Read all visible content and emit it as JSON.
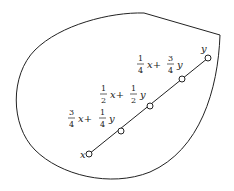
{
  "diagram": {
    "endpoints": {
      "start": {
        "label": "x",
        "cx": 89,
        "cy": 154
      },
      "end": {
        "label": "y",
        "cx": 208,
        "cy": 58
      }
    },
    "points": [
      {
        "label_a_num": "3",
        "label_a_den": "4",
        "label_b_num": "1",
        "label_b_den": "4",
        "var1": "x+",
        "var2": "y",
        "cx": 121,
        "cy": 131
      },
      {
        "label_a_num": "1",
        "label_a_den": "2",
        "label_b_num": "1",
        "label_b_den": "2",
        "var1": "x+",
        "var2": "y",
        "cx": 150,
        "cy": 106
      },
      {
        "label_a_num": "1",
        "label_a_den": "4",
        "label_b_num": "3",
        "label_b_den": "4",
        "var1": "x+",
        "var2": "y",
        "cx": 182,
        "cy": 79
      }
    ],
    "colors": {
      "stroke": "#222222",
      "background": "#ffffff"
    }
  }
}
